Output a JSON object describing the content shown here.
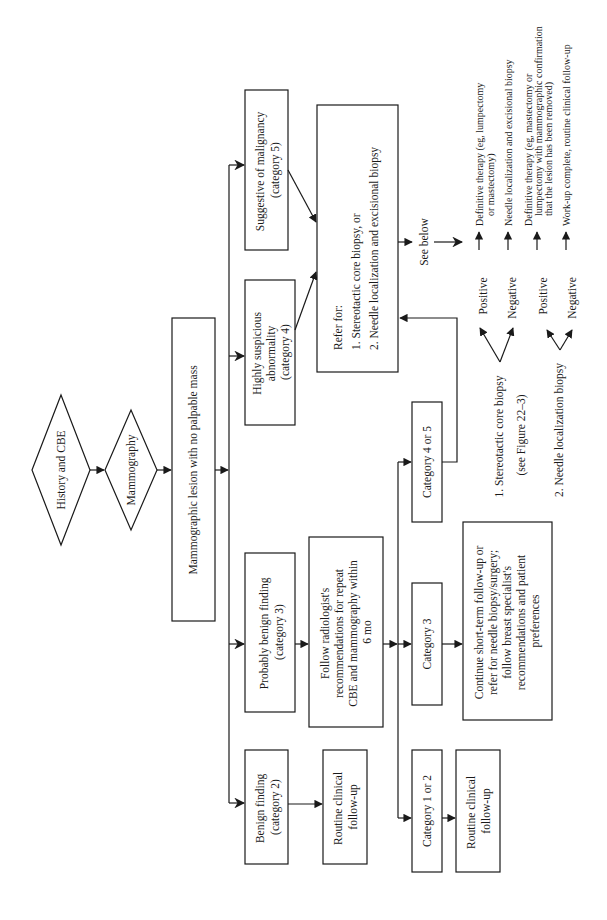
{
  "diagram": {
    "orientation": "rotated-90-ccw",
    "nodes": {
      "history_cbe": {
        "lines": [
          "History and CBE"
        ]
      },
      "mammography": {
        "lines": [
          "Mammography"
        ]
      },
      "lesion": {
        "lines": [
          "Mammographic lesion with no palpable mass"
        ]
      },
      "benign": {
        "lines": [
          "Benign finding",
          "(category 2)"
        ]
      },
      "prob_benign": {
        "lines": [
          "Probably benign finding",
          "(category 3)"
        ]
      },
      "suspicious": {
        "lines": [
          "Highly suspicious",
          "abnormality",
          "(category 4)"
        ]
      },
      "malignancy": {
        "lines": [
          "Suggestive of malignancy",
          "(category 5)"
        ]
      },
      "routine_left": {
        "lines": [
          "Routine clinical",
          "follow-up"
        ]
      },
      "follow_radiologist": {
        "lines": [
          "Follow radiologist's",
          "recommendations for repeat",
          "CBE and mammography within",
          "6 mo"
        ]
      },
      "refer_for": {
        "lines": [
          "Refer for:",
          "1. Stereotactic core biopsy, or",
          "2. Needle localization and excisional biopsy"
        ]
      },
      "cat_1_2": {
        "lines": [
          "Category 1 or 2"
        ]
      },
      "cat_3": {
        "lines": [
          "Category 3"
        ]
      },
      "cat_4_5": {
        "lines": [
          "Category 4 or 5"
        ]
      },
      "routine_right": {
        "lines": [
          "Routine clinical",
          "follow-up"
        ]
      },
      "continue": {
        "lines": [
          "Continue short-term follow-up or",
          "refer for needle biopsy/surgery;",
          "follow breast specialist's",
          "recommendations and patient",
          "preferences"
        ]
      },
      "see_below": {
        "lines": [
          "See below"
        ]
      }
    },
    "biopsy_options": [
      {
        "label": "1. Stereotactic core biopsy",
        "note": "(see Figure 22–3)",
        "positive": "Positive",
        "negative": "Negative"
      },
      {
        "label": "2. Needle localization biopsy",
        "note": "",
        "positive": "Positive",
        "negative": "Negative"
      }
    ],
    "outcomes": [
      {
        "lines": [
          "Definitive therapy (eg, lumpectomy",
          "or mastectomy)"
        ]
      },
      {
        "lines": [
          "Needle localization and excisional biopsy"
        ]
      },
      {
        "lines": [
          "Definitive therapy (eg, mastectomy or",
          "lumpectomy with mammographic confirmation",
          "that the lesion has been removed)"
        ]
      },
      {
        "lines": [
          "Work-up complete, routine clinical follow-up"
        ]
      }
    ],
    "colors": {
      "stroke": "#1a1a1a",
      "background": "#ffffff"
    }
  }
}
